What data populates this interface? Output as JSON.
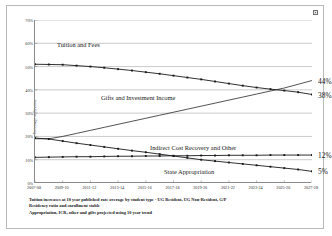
{
  "chart_data": {
    "type": "line",
    "title": "",
    "xlabel": "",
    "ylabel": "Percentage of Revenue",
    "ylim": [
      0,
      70
    ],
    "yticks": [
      "0%",
      "10%",
      "20%",
      "30%",
      "40%",
      "50%",
      "60%",
      "70%"
    ],
    "ytick_values": [
      0,
      10,
      20,
      30,
      40,
      50,
      60,
      70
    ],
    "grid": true,
    "legend_position": "inline-labels",
    "x": [
      "2007-08",
      "2008-09",
      "2009-10",
      "2010-11",
      "2011-12",
      "2012-13",
      "2013-14",
      "2014-15",
      "2015-16",
      "2016-17",
      "2017-18",
      "2018-19",
      "2019-20",
      "2020-21",
      "2021-22",
      "2022-23",
      "2023-24",
      "2024-25",
      "2025-26",
      "2026-27",
      "2027-28"
    ],
    "xticks": [
      "2007-08",
      "2009-10",
      "2011-12",
      "2013-14",
      "2015-16",
      "2017-18",
      "2019-20",
      "2021-22",
      "2023-24",
      "2025-26",
      "2027-28"
    ],
    "series": [
      {
        "name": "Tuition and Fees",
        "end_label": "38%",
        "values": [
          51.0,
          50.9,
          50.8,
          50.4,
          50.0,
          49.5,
          48.9,
          48.3,
          47.6,
          46.9,
          46.1,
          45.3,
          44.5,
          43.6,
          42.7,
          41.8,
          41.0,
          40.3,
          39.7,
          39.0,
          38.0
        ]
      },
      {
        "name": "Gifts and Investment Income",
        "end_label": "44%",
        "values": [
          19.0,
          19.0,
          20.0,
          21.3,
          22.6,
          23.9,
          25.2,
          26.5,
          27.8,
          29.1,
          30.4,
          31.7,
          33.0,
          34.3,
          35.6,
          36.9,
          38.2,
          39.5,
          40.8,
          42.4,
          44.0
        ]
      },
      {
        "name": "Indirect Cost Recovery and Other",
        "end_label": "12%",
        "values": [
          11.0,
          11.1,
          11.2,
          11.3,
          11.3,
          11.4,
          11.5,
          11.5,
          11.6,
          11.6,
          11.7,
          11.7,
          11.8,
          11.8,
          11.9,
          11.9,
          11.9,
          12.0,
          12.0,
          12.0,
          12.0
        ]
      },
      {
        "name": "State Appropriation",
        "end_label": "5%",
        "values": [
          19.3,
          18.9,
          18.0,
          17.1,
          16.3,
          15.5,
          14.7,
          13.9,
          13.2,
          12.4,
          11.6,
          10.8,
          10.0,
          9.4,
          8.8,
          8.2,
          7.6,
          7.0,
          6.4,
          5.8,
          5.0
        ]
      }
    ],
    "annotations": {
      "label_tuition": "Tuition and Fees",
      "label_gifts": "Gifts and Investment Income",
      "label_indirect": "Indirect Cost Recovery and Other",
      "label_state": "State Appropriation"
    },
    "footnotes": [
      "Tuition increases at 10 year published rate average by student type - UG Resident, UG Non-Resident, G/P",
      "Residency ratio and enrollment stable",
      "Appropriation, ICR, other and gifts projected using 10 year trend"
    ],
    "colors": {
      "line": "#1a1a1a",
      "grid": "#a7a7a7",
      "axis": "#8a8a8a",
      "text": "#151515",
      "background": "#ffffff"
    }
  }
}
